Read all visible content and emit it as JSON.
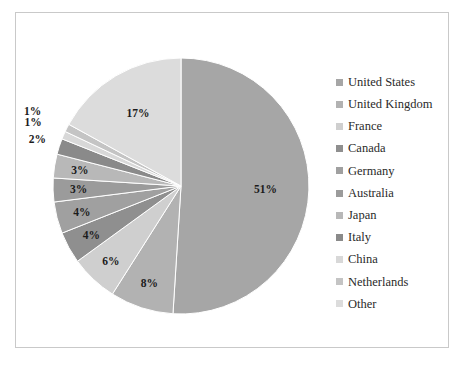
{
  "chart_data": {
    "type": "pie",
    "title": "",
    "categories": [
      "United States",
      "United Kingdom",
      "France",
      "Canada",
      "Germany",
      "Australia",
      "Japan",
      "Italy",
      "China",
      "Netherlands",
      "Other"
    ],
    "values": [
      51,
      8,
      6,
      4,
      4,
      3,
      3,
      2,
      1,
      1,
      17
    ],
    "value_labels": [
      "51%",
      "8%",
      "6%",
      "4%",
      "4%",
      "3%",
      "3%",
      "2%",
      "1%",
      "1%",
      "17%"
    ],
    "unit": "%",
    "start_angle_deg": 0,
    "direction": "clockwise",
    "legend_position": "right",
    "grid": false,
    "colors": [
      "#a6a6a6",
      "#b2b2b2",
      "#cfcfcf",
      "#8f8f8f",
      "#a0a0a0",
      "#9b9b9b",
      "#b8b8b8",
      "#8a8a8a",
      "#d8d8d8",
      "#c4c4c4",
      "#dcdcdc"
    ],
    "label_colors": [
      "#1c1c1c",
      "#1c1c1c",
      "#1c1c1c",
      "#1c1c1c",
      "#1c1c1c",
      "#1c1c1c",
      "#1c1c1c",
      "#1c1c1c",
      "#1c1c1c",
      "#1c1c1c",
      "#1c1c1c"
    ],
    "border_color": "#c9c9c9",
    "background_color": "#ffffff"
  },
  "legend": {
    "items": [
      {
        "label": "United States",
        "color": "#a6a6a6"
      },
      {
        "label": "United Kingdom",
        "color": "#b2b2b2"
      },
      {
        "label": "France",
        "color": "#cfcfcf"
      },
      {
        "label": "Canada",
        "color": "#8f8f8f"
      },
      {
        "label": "Germany",
        "color": "#a0a0a0"
      },
      {
        "label": "Australia",
        "color": "#9b9b9b"
      },
      {
        "label": "Japan",
        "color": "#b8b8b8"
      },
      {
        "label": "Italy",
        "color": "#8a8a8a"
      },
      {
        "label": "China",
        "color": "#d8d8d8"
      },
      {
        "label": "Netherlands",
        "color": "#c4c4c4"
      },
      {
        "label": "Other",
        "color": "#dcdcdc"
      }
    ]
  }
}
